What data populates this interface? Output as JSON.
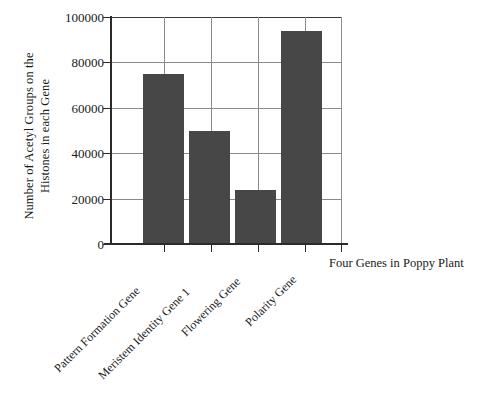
{
  "chart_data": {
    "type": "bar",
    "title": "",
    "xlabel": "Four Genes in Poppy Plant",
    "ylabel": "Number of Acetyl Groups on the Histones in each Gene",
    "ylabel_lines": [
      "Number of Acetyl Groups on the",
      "Histones in each Gene"
    ],
    "categories": [
      "Pattern Formation Gene",
      "Meristem Identity Gene 1",
      "Flowering Gene",
      "Polarity Gene"
    ],
    "values": [
      75000,
      50000,
      24000,
      94000
    ],
    "ylim": [
      0,
      100000
    ],
    "yticks": [
      0,
      20000,
      40000,
      60000,
      80000,
      100000
    ],
    "ytick_labels": [
      "0",
      "20000",
      "40000",
      "60000",
      "80000",
      "100000"
    ],
    "grid": "both",
    "legend": "none",
    "bar_color": "#474747",
    "axis_color": "#2b2b2b",
    "grid_color": "#8a8a8a",
    "background": "#ffffff"
  }
}
